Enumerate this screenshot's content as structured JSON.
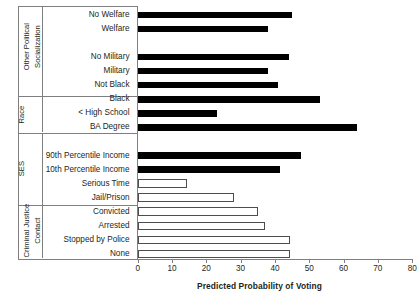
{
  "chart_data": {
    "type": "bar",
    "orientation": "horizontal",
    "title": "",
    "xlabel": "Predicted Probability of Voting",
    "ylabel": "",
    "xlim": [
      0,
      80
    ],
    "xticks": [
      0,
      10,
      20,
      30,
      40,
      50,
      60,
      70,
      80
    ],
    "grid": false,
    "legend": null,
    "categories": [
      "No Welfare",
      "Welfare",
      "No Military",
      "Military",
      "Not Black",
      "Black",
      "< High School",
      "BA Degree",
      "90th Percentile Income",
      "10th Percentile Income",
      "Serious Time",
      "Jail/Prison",
      "Convicted",
      "Arrested",
      "Stopped by Police",
      "None"
    ],
    "values": [
      45,
      38,
      44,
      38,
      41,
      53,
      23,
      64,
      47.5,
      41.5,
      14.5,
      28,
      35,
      37,
      44.5,
      44.5
    ],
    "bar_styles": [
      "filled",
      "filled",
      "filled",
      "filled",
      "filled",
      "filled",
      "filled",
      "filled",
      "filled",
      "filled",
      "hollow",
      "hollow",
      "hollow",
      "hollow",
      "hollow",
      "hollow"
    ],
    "groups": [
      {
        "label": "Other Political\nSocialization",
        "label_line1": "Other Political",
        "label_line2": "Socialization",
        "categories": [
          "No Welfare",
          "Welfare",
          "No Military",
          "Military"
        ]
      },
      {
        "label": "Race",
        "label_line1": "Race",
        "label_line2": "",
        "categories": [
          "Not Black",
          "Black"
        ]
      },
      {
        "label": "SES",
        "label_line1": "SES",
        "label_line2": "",
        "categories": [
          "< High School",
          "BA Degree",
          "90th Percentile Income",
          "10th Percentile Income"
        ]
      },
      {
        "label": "Criminal Justice\nContact",
        "label_line1": "Criminal  Justice",
        "label_line2": "Contact",
        "categories": [
          "Serious Time",
          "Jail/Prison",
          "Convicted",
          "Arrested",
          "Stopped by Police",
          "None"
        ]
      }
    ],
    "colors": {
      "filled_bar": "#000000",
      "hollow_bar_fill": "#ffffff",
      "hollow_bar_border": "#4d4d4d",
      "axis": "#7f7f7f",
      "text": "#231f20",
      "background": "#ffffff"
    }
  },
  "rows": [
    {
      "label": "No Welfare",
      "value": 45,
      "style": "filled"
    },
    {
      "label": "Welfare",
      "value": 38,
      "style": "filled"
    },
    {
      "label": "",
      "value": 0,
      "style": "none"
    },
    {
      "label": "No Military",
      "value": 44,
      "style": "filled"
    },
    {
      "label": "Military",
      "value": 38,
      "style": "filled"
    },
    {
      "label": "Not Black",
      "value": 41,
      "style": "filled"
    },
    {
      "label": "Black",
      "value": 53,
      "style": "filled"
    },
    {
      "label": "< High School",
      "value": 23,
      "style": "filled"
    },
    {
      "label": "BA Degree",
      "value": 64,
      "style": "filled"
    },
    {
      "label": "",
      "value": 0,
      "style": "none"
    },
    {
      "label": "90th Percentile Income",
      "value": 47.5,
      "style": "filled"
    },
    {
      "label": "10th Percentile Income",
      "value": 41.5,
      "style": "filled"
    },
    {
      "label": "Serious Time",
      "value": 14.5,
      "style": "hollow"
    },
    {
      "label": "Jail/Prison",
      "value": 28,
      "style": "hollow"
    },
    {
      "label": "Convicted",
      "value": 35,
      "style": "hollow"
    },
    {
      "label": "Arrested",
      "value": 37,
      "style": "hollow"
    },
    {
      "label": "Stopped by Police",
      "value": 44.5,
      "style": "hollow"
    },
    {
      "label": "None",
      "value": 44.5,
      "style": "hollow"
    }
  ],
  "group_labels": {
    "other_political_l1": "Other Political",
    "other_political_l2": "Socialization",
    "race": "Race",
    "ses": "SES",
    "criminal_l1": "Criminal  Justice",
    "criminal_l2": "Contact"
  },
  "axis": {
    "x_title": "Predicted Probability of Voting",
    "ticks": [
      "0",
      "10",
      "20",
      "30",
      "40",
      "50",
      "60",
      "70",
      "80"
    ]
  }
}
